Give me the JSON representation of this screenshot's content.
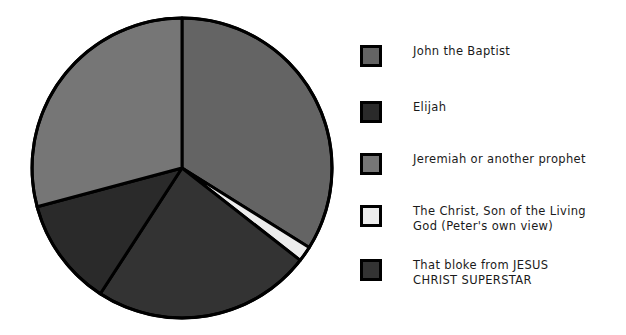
{
  "chart_data": {
    "type": "pie",
    "title": "",
    "subtitle": "",
    "xlabel": "",
    "ylabel": "",
    "legend_position": "right",
    "grid": false,
    "start_angle_deg": 90,
    "direction": "clockwise",
    "categories": [
      "John the Baptist",
      "Elijah",
      "Jeremiah or another prophet",
      "The Christ, Son of the Living God (Peter's own view)",
      "That bloke from JESUS CHRIST SUPERSTAR"
    ],
    "values": [
      33.9,
      11.7,
      29.2,
      1.7,
      23.5
    ],
    "slice_angles_deg": [
      122.0,
      42.0,
      105.0,
      6.0,
      85.0
    ],
    "colors": [
      "#646464",
      "#2a2a2a",
      "#767676",
      "#ececec",
      "#333333"
    ],
    "slices": [
      {
        "label": "John the Baptist",
        "value": 33.9,
        "color": "#646464",
        "start_deg": 0.0,
        "end_deg": 122.0
      },
      {
        "label": "The Christ, Son of the Living God (Peter's own view)",
        "value": 1.7,
        "color": "#ececec",
        "start_deg": 122.0,
        "end_deg": 128.0
      },
      {
        "label": "That bloke from JESUS CHRIST SUPERSTAR",
        "value": 23.5,
        "color": "#333333",
        "start_deg": 128.0,
        "end_deg": 213.0
      },
      {
        "label": "Elijah",
        "value": 11.7,
        "color": "#2a2a2a",
        "start_deg": 213.0,
        "end_deg": 255.0
      },
      {
        "label": "Jeremiah or another prophet",
        "value": 29.2,
        "color": "#767676",
        "start_deg": 255.0,
        "end_deg": 360.0
      }
    ],
    "geometry": {
      "center_x": 182,
      "center_y": 168,
      "radius": 150,
      "stroke": "#000000",
      "stroke_width": 3
    }
  },
  "legend": {
    "title": "",
    "items": [
      {
        "label": "John the Baptist",
        "color": "#646464"
      },
      {
        "label": "Elijah",
        "color": "#2a2a2a"
      },
      {
        "label": "Jeremiah or another prophet",
        "color": "#767676"
      },
      {
        "label": "The Christ, Son of the Living\nGod (Peter's own view)",
        "color": "#ececec"
      },
      {
        "label": "That bloke from JESUS\nCHRIST SUPERSTAR",
        "color": "#333333"
      }
    ]
  },
  "page": {
    "background": "#ffffff",
    "outline_color": "#000000"
  }
}
